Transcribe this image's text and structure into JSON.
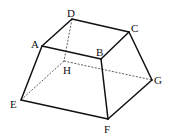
{
  "figure": {
    "type": "frustum (truncated quadrilateral pyramid)",
    "vertices": {
      "A": [
        42,
        46
      ],
      "B": [
        101,
        59
      ],
      "C": [
        129,
        32
      ],
      "D": [
        72,
        19
      ],
      "E": [
        21,
        100
      ],
      "F": [
        108,
        119
      ],
      "G": [
        152,
        80
      ],
      "H": [
        64,
        61
      ]
    },
    "labels": [
      {
        "text": "A",
        "x": 31,
        "y": 48
      },
      {
        "text": "B",
        "x": 96,
        "y": 56
      },
      {
        "text": "C",
        "x": 131,
        "y": 32
      },
      {
        "text": "D",
        "x": 67,
        "y": 17
      },
      {
        "text": "E",
        "x": 10,
        "y": 108
      },
      {
        "text": "F",
        "x": 104,
        "y": 133
      },
      {
        "text": "G",
        "x": 154,
        "y": 84
      },
      {
        "text": "H",
        "x": 63,
        "y": 74
      }
    ],
    "solid_edges": [
      [
        "A",
        "B"
      ],
      [
        "B",
        "C"
      ],
      [
        "C",
        "D"
      ],
      [
        "D",
        "A"
      ],
      [
        "A",
        "E"
      ],
      [
        "B",
        "F"
      ],
      [
        "C",
        "G"
      ],
      [
        "E",
        "F"
      ],
      [
        "F",
        "G"
      ]
    ],
    "hidden_edges": [
      [
        "D",
        "H"
      ],
      [
        "H",
        "E"
      ],
      [
        "H",
        "G"
      ]
    ]
  }
}
